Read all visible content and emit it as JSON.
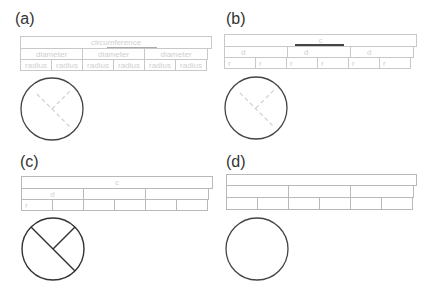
{
  "panels": [
    {
      "label": "(a)",
      "table": {
        "top": "circumference",
        "middle": [
          "diameter",
          "diameter",
          "diameter"
        ],
        "bottom": [
          "radius",
          "radius",
          "radius",
          "radius",
          "radius",
          "radius"
        ]
      },
      "circle": {
        "radius_lines": "dashed-faint"
      }
    },
    {
      "label": "(b)",
      "table": {
        "top": "c",
        "middle": [
          "d",
          "d",
          "d"
        ],
        "bottom": [
          "r",
          "r",
          "r",
          "r",
          "r",
          "r"
        ]
      },
      "circle": {
        "radius_lines": "dashed-faint"
      }
    },
    {
      "label": "(c)",
      "table": {
        "top": "c",
        "middle": [
          "d",
          "",
          ""
        ],
        "bottom": [
          "r",
          "",
          "",
          "",
          "",
          ""
        ]
      },
      "circle": {
        "radius_lines": "solid"
      }
    },
    {
      "label": "(d)",
      "table": {
        "top": "",
        "middle": [
          "",
          "",
          ""
        ],
        "bottom": [
          "",
          "",
          "",
          "",
          "",
          ""
        ]
      },
      "circle": {
        "radius_lines": "none"
      }
    }
  ],
  "colors": {
    "circle_stroke": "#444444",
    "table_border": "#b9b9b9",
    "faint_text": "#cfcfcf",
    "underline": "#444444"
  }
}
